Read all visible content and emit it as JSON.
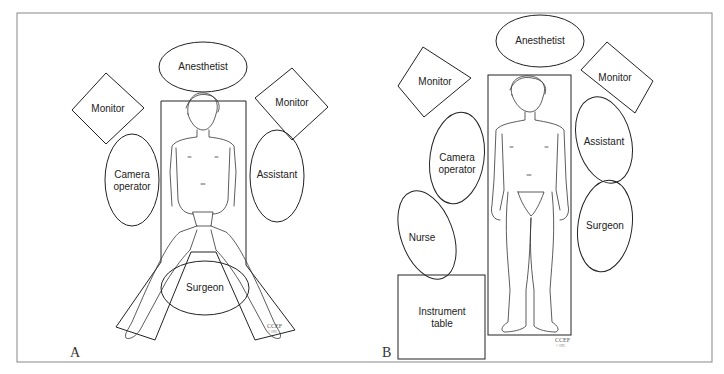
{
  "panels": [
    {
      "label": "A",
      "position": "lithotomy (legs spread)",
      "items": {
        "anesthetist": "Anesthetist",
        "monitor_left": "Monitor",
        "monitor_right": "Monitor",
        "camera_operator_line1": "Camera",
        "camera_operator_line2": "operator",
        "assistant": "Assistant",
        "surgeon": "Surgeon"
      },
      "signature": "CCEF",
      "signature_year": "© 1995"
    },
    {
      "label": "B",
      "position": "supine",
      "items": {
        "anesthetist": "Anesthetist",
        "monitor_left": "Monitor",
        "monitor_right": "Monitor",
        "camera_operator_line1": "Camera",
        "camera_operator_line2": "operator",
        "assistant": "Assistant",
        "surgeon": "Surgeon",
        "nurse": "Nurse",
        "instrument_table_line1": "Instrument",
        "instrument_table_line2": "table"
      },
      "signature": "CCEF",
      "signature_year": "© 1995"
    }
  ],
  "colors": {
    "stroke": "#222222",
    "frame": "#888888",
    "background": "#ffffff"
  }
}
